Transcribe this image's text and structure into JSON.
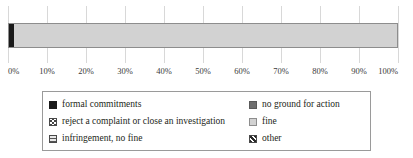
{
  "chart_data": {
    "type": "bar",
    "orientation": "horizontal",
    "stacked": true,
    "normalized_percent": true,
    "title": "",
    "subtitle": "",
    "xlabel": "",
    "ylabel": "",
    "categories": [
      ""
    ],
    "xlim": [
      0,
      100
    ],
    "xticks": [
      "0%",
      "10%",
      "20%",
      "30%",
      "40%",
      "50%",
      "60%",
      "70%",
      "80%",
      "90%",
      "100%"
    ],
    "xtick_values": [
      0,
      10,
      20,
      30,
      40,
      50,
      60,
      70,
      80,
      90,
      100
    ],
    "grid": true,
    "grid_axis": "x",
    "legend_position": "bottom",
    "series": [
      {
        "name": "formal commitments",
        "pattern": "solid-black",
        "color": "#1a1a1a",
        "values": [
          1.3
        ]
      },
      {
        "name": "no ground for action",
        "pattern": "solid-darkgray",
        "color": "#6f6f6f",
        "values": [
          0
        ]
      },
      {
        "name": "reject a complaint or close an investigation",
        "pattern": "crosshatch",
        "color": "#ffffff",
        "values": [
          0
        ]
      },
      {
        "name": "fine",
        "pattern": "solid-lightgray",
        "color": "#d2d2d2",
        "values": [
          98.7
        ]
      },
      {
        "name": "infringement, no fine",
        "pattern": "horizontal-lines",
        "color": "#e8e8e8",
        "values": [
          0
        ]
      },
      {
        "name": "other",
        "pattern": "diagonal-lines",
        "color": "#ffffff",
        "values": [
          0
        ]
      }
    ]
  },
  "legend": {
    "items": [
      {
        "label": "formal commitments",
        "swatch": "sw-formal",
        "icon": "legend-swatch-solid-black-icon"
      },
      {
        "label": "no ground for action",
        "swatch": "sw-noground",
        "icon": "legend-swatch-solid-darkgray-icon"
      },
      {
        "label": "reject a complaint or close an investigation",
        "swatch": "sw-reject",
        "icon": "legend-swatch-crosshatch-icon"
      },
      {
        "label": "fine",
        "swatch": "sw-fine",
        "icon": "legend-swatch-solid-lightgray-icon"
      },
      {
        "label": "infringement, no fine",
        "swatch": "sw-infringe",
        "icon": "legend-swatch-horizontal-lines-icon"
      },
      {
        "label": "other",
        "swatch": "sw-other",
        "icon": "legend-swatch-diagonal-lines-icon"
      }
    ]
  },
  "colors": {
    "gridline": "#d8d8d8",
    "axis": "#b9b9b9",
    "bar_border": "#8d8d8d",
    "legend_border": "#9a9a9a",
    "text": "#231f20"
  }
}
